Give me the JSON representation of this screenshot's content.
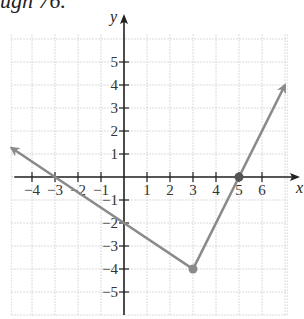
{
  "caption": "ugh 76.",
  "chart_data": {
    "type": "line",
    "title": "",
    "xlabel": "x",
    "ylabel": "y",
    "xlim": [
      -4.9,
      7.1
    ],
    "ylim": [
      -6,
      6.2
    ],
    "grid": true,
    "x_ticks": [
      -4,
      -3,
      -2,
      -1,
      1,
      2,
      3,
      4,
      5,
      6
    ],
    "y_ticks": [
      5,
      4,
      3,
      2,
      1,
      -1,
      -2,
      -3,
      -4,
      -5
    ],
    "series": [
      {
        "name": "piecewise linear (V-shape)",
        "color": "#8a8a8a",
        "points": [
          [
            -4.9,
            1.27
          ],
          [
            -3,
            0
          ],
          [
            0,
            -2
          ],
          [
            3,
            -4
          ],
          [
            5,
            0
          ],
          [
            7,
            4
          ]
        ],
        "arrows": [
          "start",
          "end"
        ]
      }
    ],
    "marked_points": [
      {
        "x": 3,
        "y": -4,
        "label": "vertex"
      },
      {
        "x": 5,
        "y": 0,
        "label": "x-intercept"
      }
    ]
  }
}
